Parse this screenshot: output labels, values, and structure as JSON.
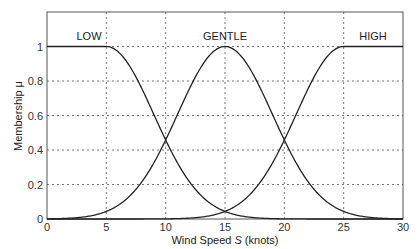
{
  "chart_data": {
    "type": "line",
    "title": "",
    "xlabel": "Wind Speed S (knots)",
    "ylabel": "Membership μ",
    "xlim": [
      0,
      30
    ],
    "ylim": [
      0,
      1.2
    ],
    "xticks": [
      0,
      5,
      10,
      15,
      20,
      25,
      30
    ],
    "yticks": [
      0,
      0.2,
      0.4,
      0.6,
      0.8,
      1
    ],
    "ytick_labels": [
      "0",
      "0.2",
      "0.4",
      "0.6",
      "0.8",
      "1"
    ],
    "grid": true,
    "legend": "none",
    "annotations": [
      {
        "text": "LOW",
        "x": 2.5,
        "y": 1.1
      },
      {
        "text": "GENTLE",
        "x": 15,
        "y": 1.1
      },
      {
        "text": "HIGH",
        "x": 27.5,
        "y": 1.1
      }
    ],
    "series": [
      {
        "name": "LOW",
        "x": [
          0,
          5,
          7.5,
          10,
          12.5,
          15,
          20,
          30
        ],
        "values": [
          1,
          1,
          0.82,
          0.46,
          0.14,
          0.04,
          0.0,
          0.0
        ]
      },
      {
        "name": "GENTLE",
        "x": [
          0,
          5,
          7.5,
          10,
          12.5,
          15,
          17.5,
          20,
          22.5,
          25,
          30
        ],
        "values": [
          0.0,
          0.04,
          0.14,
          0.46,
          0.82,
          1,
          0.82,
          0.46,
          0.14,
          0.04,
          0.0
        ]
      },
      {
        "name": "HIGH",
        "x": [
          0,
          10,
          15,
          17.5,
          20,
          22.5,
          25,
          30
        ],
        "values": [
          0.0,
          0.0,
          0.04,
          0.14,
          0.46,
          0.82,
          1,
          1
        ]
      }
    ]
  },
  "labels": {
    "xlabel_prefix": "Wind Speed ",
    "xlabel_var": "S",
    "xlabel_suffix": " (knots)",
    "ylabel": "Membership μ",
    "low": "LOW",
    "gentle": "GENTLE",
    "high": "HIGH"
  }
}
